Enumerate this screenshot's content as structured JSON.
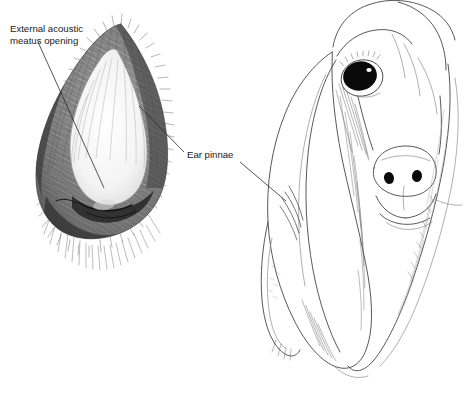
{
  "figure": {
    "background_color": "#ffffff",
    "ink_color": "#2b2b2b",
    "width": 467,
    "height": 394,
    "style": "pen-and-ink line drawing with stipple and cross-hatch shading"
  },
  "labels": [
    {
      "id": "external-acoustic-meatus-opening",
      "line1": "External acoustic",
      "line2": "meatus opening",
      "text_x": 10,
      "text_y": 32,
      "line_height": 11.5,
      "leader": {
        "from_x": 38,
        "from_y": 42,
        "to_x": 104,
        "to_y": 188
      }
    },
    {
      "id": "ear-pinnae",
      "line1": "Ear pinnae",
      "line2": "",
      "text_x": 187,
      "text_y": 158,
      "line_height": 11.5,
      "leader": {
        "from_x": 184,
        "from_y": 152,
        "to_x": 139,
        "to_y": 106
      },
      "leader2": {
        "from_x": 240,
        "from_y": 162,
        "to_x": 286,
        "to_y": 201
      }
    }
  ],
  "subjects": [
    {
      "id": "isolated-ear-pinna",
      "name": "Detached ear pinna specimen",
      "position": "left",
      "description": "Densely hatched upright ear flap with furred margins and pale inner concha, folded base showing the external acoustic meatus opening"
    },
    {
      "id": "dog-head",
      "name": "Basset hound head",
      "position": "right",
      "description": "Three-quarter line drawing of a long-eared hound with dark eye, broad nose and two long pendulous ear pinnae"
    }
  ],
  "features": [
    {
      "id": "eye",
      "name": "Eye",
      "fill": "#0a0a0a",
      "highlight": "#ffffff"
    },
    {
      "id": "nose",
      "name": "Nose / nasal planum",
      "nostril_fill": "#0a0a0a"
    },
    {
      "id": "muzzle",
      "name": "Muzzle and jowls"
    },
    {
      "id": "ear-left",
      "name": "Near ear pinna"
    },
    {
      "id": "ear-right",
      "name": "Far ear pinna"
    }
  ]
}
